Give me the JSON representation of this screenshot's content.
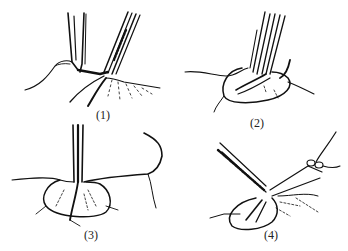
{
  "figure": {
    "panels": [
      {
        "id": 1,
        "label": "(1)",
        "description": "forceps and clamp at tissue mound"
      },
      {
        "id": 2,
        "label": "(2)",
        "description": "forceps inserted into oval tissue with loop"
      },
      {
        "id": 3,
        "label": "(3)",
        "description": "vertical instrument in oval tissue with thread"
      },
      {
        "id": 4,
        "label": "(4)",
        "description": "forceps and tied ligature at tissue"
      }
    ],
    "ink_color": "#111111",
    "background": "#ffffff"
  }
}
